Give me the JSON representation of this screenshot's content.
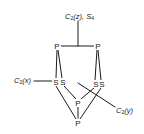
{
  "diagram": {
    "atoms": [
      {
        "id": "P1",
        "label": "P",
        "x": 57,
        "y": 46
      },
      {
        "id": "P2",
        "label": "P",
        "x": 98,
        "y": 46
      },
      {
        "id": "S1",
        "label": "S",
        "x": 56,
        "y": 82
      },
      {
        "id": "S2",
        "label": "S",
        "x": 63,
        "y": 82
      },
      {
        "id": "S3",
        "label": "S",
        "x": 96,
        "y": 84
      },
      {
        "id": "S4",
        "label": "S",
        "x": 102,
        "y": 84
      },
      {
        "id": "P3",
        "label": "P",
        "x": 78,
        "y": 103
      },
      {
        "id": "P4",
        "label": "P",
        "x": 78,
        "y": 123
      }
    ],
    "axes": {
      "z": {
        "label_main": "C",
        "label_sub": "2",
        "label_paren": "(z), ",
        "label_extra_main": "S",
        "label_extra_sub": "4"
      },
      "x": {
        "label_main": "C",
        "label_sub": "2",
        "label_paren": "(x)"
      },
      "y": {
        "label_main": "C",
        "label_sub": "2",
        "label_paren": "(y)"
      }
    }
  }
}
